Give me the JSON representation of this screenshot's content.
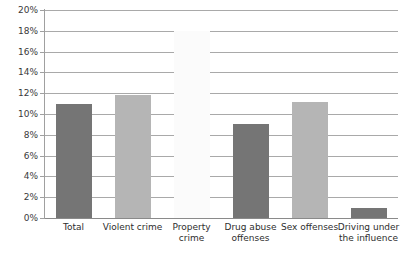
{
  "chart_data": {
    "type": "bar",
    "title": "",
    "subtitle": "",
    "xlabel": "",
    "ylabel": "",
    "categories": [
      "Total",
      "Violent crime",
      "Property crime",
      "Drug abuse offenses",
      "Sex offenses",
      "Driving under the influence"
    ],
    "values": [
      11.0,
      11.8,
      18.0,
      9.0,
      11.2,
      1.0
    ],
    "value_labels": [
      "",
      "",
      "",
      "",
      "",
      ""
    ],
    "series": [
      {
        "name": "Percent",
        "values": [
          11.0,
          11.8,
          18.0,
          9.0,
          11.2,
          1.0
        ]
      }
    ],
    "bar_colors": [
      "#757575",
      "#b5b5b5",
      "#fbfbfb",
      "#757575",
      "#b5b5b5",
      "#757575"
    ],
    "ylim": [
      0,
      20
    ],
    "ytick_values": [
      0,
      2,
      4,
      6,
      8,
      10,
      12,
      14,
      16,
      18,
      20
    ],
    "ytick_labels": [
      "0%",
      "2%",
      "4%",
      "6%",
      "8%",
      "10%",
      "12%",
      "14%",
      "16%",
      "18%",
      "20%"
    ],
    "grid": true,
    "grid_axis": "y",
    "legend": false,
    "legend_position": "none",
    "annotations": []
  },
  "style": {
    "background_color": "#ffffff",
    "gridline_color": "#a9a9a9",
    "axis_color": "#a0a0a0",
    "tick_label_color": "#3a3a3a",
    "category_label_color": "#2e2e2e"
  }
}
